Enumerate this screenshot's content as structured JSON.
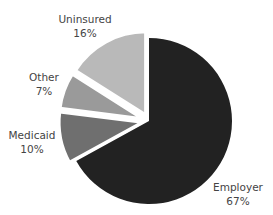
{
  "chart_data": {
    "type": "pie",
    "title": "",
    "categories": [
      "Employer",
      "Medicaid",
      "Other",
      "Uninsured"
    ],
    "values": [
      67,
      10,
      7,
      16
    ],
    "labels": [
      "67%",
      "10%",
      "7%",
      "16%"
    ],
    "unit": "%",
    "exploded": [
      "Medicaid",
      "Other",
      "Uninsured"
    ],
    "start_angle_deg": 0,
    "direction": "clockwise",
    "legend": "none",
    "colors": {
      "Employer": "#222222",
      "Medicaid": "#6f6f6f",
      "Other": "#9a9a9a",
      "Uninsured": "#b9b9b9"
    }
  },
  "slices": [
    {
      "name": "Employer",
      "pct_label": "67%"
    },
    {
      "name": "Medicaid",
      "pct_label": "10%"
    },
    {
      "name": "Other",
      "pct_label": "7%"
    },
    {
      "name": "Uninsured",
      "pct_label": "16%"
    }
  ]
}
